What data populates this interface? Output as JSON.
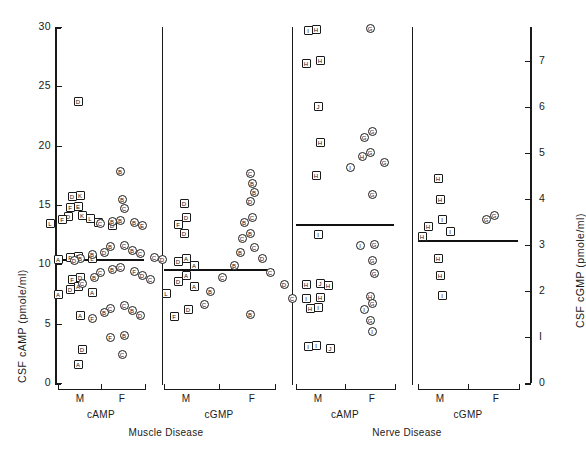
{
  "chart_data": {
    "type": "scatter",
    "title": "",
    "ylabel_left": "CSF cAMP (pmole/ml)",
    "ylabel_right": "CSF cGMP (pmole/ml)",
    "xlabel": "",
    "ylim_left": [
      0,
      30
    ],
    "ylim_right": [
      0,
      7.75
    ],
    "yticks_left": [
      0,
      5,
      10,
      15,
      20,
      25,
      30
    ],
    "ytick_labels_left": [
      "0",
      "5",
      "10",
      "15",
      "20",
      "25",
      "30"
    ],
    "yticks_right": [
      0,
      1,
      2,
      3,
      4,
      5,
      6,
      7
    ],
    "ytick_labels_right": [
      "0",
      "I",
      "2",
      "3",
      "4",
      "5",
      "6",
      "7"
    ],
    "grid": false,
    "legend": "none",
    "marker_note": "squares = Male (M), circles = Female (F); letter inside marker is the patient diagnosis code",
    "sex_labels": [
      "M",
      "F"
    ],
    "analyte_labels": [
      "cAMP",
      "cGMP"
    ],
    "groups": [
      {
        "name": "Muscle Disease",
        "name_lines": [
          "Muscle Disease"
        ],
        "panels": [
          {
            "analyte": "cAMP",
            "axis": "left",
            "mean": 10.4,
            "series": [
              {
                "sex": "M",
                "marker": "square",
                "values": [
                  23.7,
                  15.8,
                  15.7,
                  14.9,
                  14.8,
                  14.1,
                  14.0,
                  13.9,
                  13.8,
                  13.5,
                  13.4,
                  13.3,
                  10.7,
                  10.6,
                  10.5,
                  10.4,
                  8.9,
                  8.7,
                  8.1,
                  7.9,
                  7.6,
                  7.5,
                  5.7,
                  2.8,
                  1.6
                ],
                "codes": [
                  "D",
                  "K",
                  "D",
                  "E",
                  "F",
                  "K",
                  "D",
                  "L",
                  "F",
                  "A",
                  "L",
                  "D",
                  "D",
                  "F",
                  "L",
                  "A",
                  "D",
                  "F",
                  "A",
                  "D",
                  "A",
                  "A",
                  "A",
                  "D",
                  "A"
                ]
              },
              {
                "sex": "F",
                "marker": "circle",
                "values": [
                  17.8,
                  15.5,
                  14.7,
                  13.7,
                  13.6,
                  13.5,
                  13.4,
                  13.3,
                  11.6,
                  11.5,
                  11.2,
                  11.0,
                  10.9,
                  10.8,
                  10.6,
                  10.5,
                  10.4,
                  10.3,
                  9.7,
                  9.6,
                  9.4,
                  9.3,
                  9.1,
                  8.9,
                  8.7,
                  8.4,
                  6.5,
                  6.3,
                  6.1,
                  5.9,
                  5.7,
                  5.4,
                  4.0,
                  3.8,
                  2.4
                ],
                "codes": [
                  "B",
                  "B",
                  "C",
                  "B",
                  "B",
                  "B",
                  "C",
                  "E",
                  "C",
                  "B",
                  "B",
                  "D",
                  "C",
                  "B",
                  "C",
                  "B",
                  "D",
                  "D",
                  "C",
                  "B",
                  "F",
                  "C",
                  "D",
                  "B",
                  "C",
                  "C",
                  "C",
                  "C",
                  "B",
                  "B",
                  "D",
                  "F",
                  "B",
                  "F",
                  "C"
                ]
              }
            ]
          },
          {
            "analyte": "cGMP",
            "axis": "right",
            "mean": 2.45,
            "series": [
              {
                "sex": "M",
                "marker": "square",
                "values": [
                  3.9,
                  3.6,
                  3.45,
                  3.25,
                  2.7,
                  2.65,
                  2.55,
                  2.35,
                  2.2,
                  2.1,
                  1.95,
                  1.6,
                  1.45
                ],
                "codes": [
                  "D",
                  "D",
                  "F",
                  "D",
                  "A",
                  "D",
                  "A",
                  "A",
                  "D",
                  "A",
                  "L",
                  "D",
                  "F"
                ]
              },
              {
                "sex": "F",
                "marker": "circle",
                "values": [
                  4.55,
                  4.35,
                  4.15,
                  3.95,
                  3.6,
                  3.5,
                  3.25,
                  3.15,
                  2.95,
                  2.85,
                  2.7,
                  2.55,
                  2.4,
                  2.3,
                  2.15,
                  2.0,
                  1.85,
                  1.7,
                  1.5
                ],
                "codes": [
                  "C",
                  "B",
                  "B",
                  "D",
                  "C",
                  "B",
                  "B",
                  "C",
                  "C",
                  "B",
                  "D",
                  "B",
                  "C",
                  "C",
                  "D",
                  "B",
                  "C",
                  "C",
                  "B"
                ]
              }
            ]
          }
        ]
      },
      {
        "name": "Nerve Disease",
        "name_lines": [
          "Nerve Disease"
        ],
        "panels": [
          {
            "analyte": "cAMP",
            "axis": "left",
            "mean": 13.3,
            "series": [
              {
                "sex": "M",
                "marker": "square",
                "values": [
                  29.8,
                  29.7,
                  27.2,
                  26.9,
                  23.3,
                  20.3,
                  17.5,
                  12.5,
                  8.4,
                  8.3,
                  8.2,
                  7.2,
                  7.1,
                  6.4,
                  6.3,
                  3.2,
                  3.1,
                  2.9
                ],
                "codes": [
                  "H",
                  "I",
                  "H",
                  "H",
                  "J",
                  "H",
                  "H",
                  "I",
                  "J",
                  "H",
                  "H",
                  "H",
                  "I",
                  "I",
                  "H",
                  "I",
                  "I",
                  "J"
                ]
              },
              {
                "sex": "F",
                "marker": "circle",
                "values": [
                  29.9,
                  21.2,
                  20.7,
                  19.4,
                  19.1,
                  18.6,
                  18.2,
                  15.9,
                  11.7,
                  11.6,
                  10.3,
                  9.2,
                  7.3,
                  6.7,
                  6.2,
                  5.3,
                  4.3
                ],
                "codes": [
                  "G",
                  "G",
                  "G",
                  "G",
                  "H",
                  "G",
                  "I",
                  "G",
                  "G",
                  "I",
                  "G",
                  "G",
                  "H",
                  "G",
                  "I",
                  "G",
                  "I"
                ]
              }
            ]
          },
          {
            "analyte": "cGMP",
            "axis": "right",
            "mean": 3.1,
            "series": [
              {
                "sex": "M",
                "marker": "square",
                "values": [
                  4.45,
                  4.0,
                  3.55,
                  3.4,
                  3.3,
                  3.2,
                  2.7,
                  2.35,
                  1.9
                ],
                "codes": [
                  "H",
                  "H",
                  "I",
                  "H",
                  "I",
                  "H",
                  "H",
                  "H",
                  "I"
                ]
              },
              {
                "sex": "F",
                "marker": "circle",
                "values": [
                  3.65,
                  3.55
                ],
                "codes": [
                  "G",
                  "G"
                ]
              }
            ]
          }
        ]
      },
      {
        "name": "Motor Neuron Disease",
        "name_lines": [
          "Motor",
          "Neuron Disease"
        ],
        "panels": [
          {
            "analyte": "cAMP",
            "axis": "left",
            "mean": 6.5,
            "series": [
              {
                "sex": "M",
                "marker": "square",
                "values": [
                  12.5,
                  10.3,
                  10.2,
                  9.6,
                  9.0,
                  7.6,
                  7.5,
                  7.4,
                  7.2,
                  7.0,
                  6.9,
                  6.8,
                  6.7,
                  6.5,
                  6.4,
                  6.2,
                  5.2,
                  5.1,
                  5.0,
                  4.8,
                  4.7,
                  4.5,
                  4.3,
                  4.2,
                  4.0,
                  3.9,
                  3.7,
                  3.2,
                  2.6
                ],
                "codes": [
                  "N",
                  "N",
                  "M",
                  "N",
                  "N",
                  "N",
                  "M",
                  "N",
                  "M",
                  "M",
                  "N",
                  "M",
                  "N",
                  "M",
                  "N",
                  "N",
                  "M",
                  "N",
                  "N",
                  "M",
                  "N",
                  "N",
                  "M",
                  "M",
                  "N",
                  "M",
                  "N",
                  "M",
                  "N"
                ]
              },
              {
                "sex": "F",
                "marker": "circle",
                "values": [
                  9.6,
                  8.7,
                  8.4,
                  7.0,
                  6.9,
                  6.7,
                  6.5,
                  6.4,
                  6.2,
                  5.9,
                  5.1,
                  4.9,
                  3.9,
                  3.8,
                  3.6,
                  3.4
                ],
                "codes": [
                  "N",
                  "N",
                  "M",
                  "N",
                  "N",
                  "M",
                  "N",
                  "N",
                  "N",
                  "N",
                  "N",
                  "N",
                  "M",
                  "N",
                  "N",
                  "M"
                ]
              }
            ]
          },
          {
            "analyte": "cGMP",
            "axis": "right",
            "mean": 1.65,
            "series": [
              {
                "sex": "M",
                "marker": "square",
                "values": [
                  2.55,
                  2.2,
                  1.95,
                  1.9,
                  1.85,
                  1.8,
                  1.75,
                  1.7,
                  1.65,
                  1.6,
                  1.55,
                  1.5,
                  1.4,
                  1.35,
                  1.2,
                  0.95,
                  0.75
                ],
                "codes": [
                  "N",
                  "N",
                  "M",
                  "N",
                  "N",
                  "N",
                  "M",
                  "N",
                  "M",
                  "N",
                  "N",
                  "M",
                  "N",
                  "N",
                  "M",
                  "N",
                  "M"
                ]
              },
              {
                "sex": "F",
                "marker": "circle",
                "values": [
                  2.4,
                  2.2,
                  1.95,
                  1.9,
                  1.8,
                  1.7,
                  1.65,
                  1.25
                ],
                "codes": [
                  "N",
                  "N",
                  "N",
                  "M",
                  "N",
                  "N",
                  "N",
                  "N"
                ]
              }
            ]
          }
        ]
      },
      {
        "name": "Miscellaneous",
        "name_lines": [
          "Miscellaneous"
        ],
        "panels": [
          {
            "analyte": "cAMP",
            "axis": "left",
            "mean": 15.2,
            "series": [
              {
                "sex": "M",
                "marker": "square",
                "values": [
                  30.3,
                  22.5,
                  18.7,
                  18.0,
                  16.1,
                  14.3,
                  13.2,
                  12.9,
                  11.1,
                  10.9,
                  10.6,
                  9.8,
                  9.5,
                  6.0
                ],
                "codes": [
                  "Q",
                  "R",
                  "S",
                  "S",
                  "R",
                  "S",
                  "S",
                  "U",
                  "R",
                  "T",
                  "U",
                  "Q",
                  "Q",
                  "T"
                ]
              },
              {
                "sex": "F",
                "marker": "circle",
                "values": [
                  11.4,
                  10.6,
                  10.0,
                  9.8,
                  8.6,
                  8.2
                ],
                "codes": [
                  "U",
                  "U",
                  "U",
                  "U",
                  "U",
                  "U"
                ]
              }
            ]
          },
          {
            "analyte": "cGMP",
            "axis": "right",
            "mean": 3.65,
            "series": [
              {
                "sex": "M",
                "marker": "square",
                "values": [
                  7.25,
                  6.85,
                  4.2,
                  3.95,
                  3.7,
                  3.6,
                  3.05,
                  2.65,
                  2.3,
                  1.9,
                  1.75,
                  1.6,
                  1.55,
                  1.05
                ],
                "codes": [
                  "S",
                  "R",
                  "S",
                  "U",
                  "S",
                  "R",
                  "Q",
                  "Q",
                  "R",
                  "U",
                  "U",
                  "R",
                  "T",
                  "S"
                ]
              },
              {
                "sex": "F",
                "marker": "circle",
                "values": [
                  4.05,
                  3.95,
                  3.3,
                  3.15,
                  1.65
                ],
                "codes": [
                  "U",
                  "U",
                  "U",
                  "U",
                  "U"
                ]
              }
            ]
          }
        ]
      }
    ]
  },
  "layout": {
    "left_axis_x": 55,
    "right_axis_x": 530,
    "y_top_px": 27,
    "y_bottom_px": 383,
    "dividers_x": [
      162,
      292,
      412
    ],
    "columns": [
      {
        "center": 80,
        "half": 22
      },
      {
        "center": 122,
        "half": 22
      },
      {
        "center": 186,
        "half": 22
      },
      {
        "center": 252,
        "half": 22
      },
      {
        "center": 318,
        "half": 22
      },
      {
        "center": 372,
        "half": 22
      },
      {
        "center": 440,
        "half": 22
      },
      {
        "center": 496,
        "half": 22
      }
    ]
  }
}
